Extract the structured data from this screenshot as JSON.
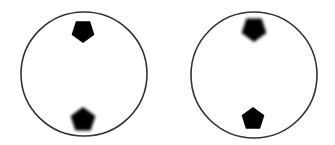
{
  "figure": {
    "background": "#ffffff",
    "stroke_color": "#333333",
    "fill_color": "#000000",
    "panels": [
      {
        "id": "left",
        "circle": {
          "cx": 84,
          "cy": 74,
          "rx": 63,
          "ry": 62
        },
        "shapes": [
          {
            "type": "pentagon",
            "position": "top",
            "orientation": "point-down",
            "cx": 83,
            "cy": 31,
            "r": 12,
            "blurred": false
          },
          {
            "type": "pentagon",
            "position": "bottom",
            "orientation": "point-up",
            "cx": 83,
            "cy": 120,
            "r": 13,
            "blurred": true
          }
        ]
      },
      {
        "id": "right",
        "circle": {
          "cx": 254,
          "cy": 75,
          "rx": 63,
          "ry": 63
        },
        "shapes": [
          {
            "type": "pentagon",
            "position": "top",
            "orientation": "point-down",
            "cx": 254,
            "cy": 29,
            "r": 13,
            "blurred": true
          },
          {
            "type": "pentagon",
            "position": "bottom",
            "orientation": "point-up",
            "cx": 253,
            "cy": 119,
            "r": 12,
            "blurred": false
          }
        ]
      }
    ]
  }
}
